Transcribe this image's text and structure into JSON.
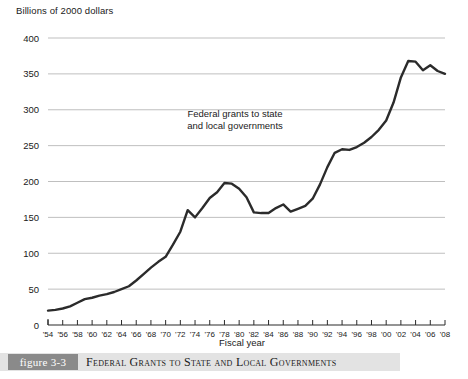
{
  "chart_data": {
    "type": "line",
    "title": "",
    "ylabel": "Billions of 2000 dollars",
    "xlabel": "Fiscal year",
    "annotation": "Federal grants to state and local governments",
    "annotation_lines": [
      "Federal grants to state",
      "and local governments"
    ],
    "ylim": [
      0,
      400
    ],
    "yticks": [
      0,
      50,
      100,
      150,
      200,
      250,
      300,
      350,
      400
    ],
    "ytick_labels": [
      "0",
      "50",
      "100",
      "150",
      "200",
      "250",
      "300",
      "350",
      "400"
    ],
    "grid": "horizontal",
    "legend": "none",
    "xlim": [
      1954,
      2008
    ],
    "xticks": [
      1954,
      1956,
      1958,
      1960,
      1962,
      1964,
      1966,
      1968,
      1970,
      1972,
      1974,
      1976,
      1978,
      1980,
      1982,
      1984,
      1986,
      1988,
      1990,
      1992,
      1994,
      1996,
      1998,
      2000,
      2002,
      2004,
      2006,
      2008
    ],
    "xtick_labels": [
      "'54",
      "'56",
      "'58",
      "'60",
      "'62",
      "'64",
      "'66",
      "'68",
      "'70",
      "'72",
      "'74",
      "'76",
      "'78",
      "'80",
      "'82",
      "'84",
      "'86",
      "'88",
      "'90",
      "'92",
      "'94",
      "'96",
      "'98",
      "'00",
      "'02",
      "'04",
      "'06",
      "'08"
    ],
    "series": [
      {
        "name": "Federal grants to state and local governments",
        "color": "#2b2b2b",
        "x": [
          1954,
          1955,
          1956,
          1957,
          1958,
          1959,
          1960,
          1961,
          1962,
          1963,
          1964,
          1965,
          1966,
          1967,
          1968,
          1969,
          1970,
          1971,
          1972,
          1973,
          1974,
          1975,
          1976,
          1977,
          1978,
          1979,
          1980,
          1981,
          1982,
          1983,
          1984,
          1985,
          1986,
          1987,
          1988,
          1989,
          1990,
          1991,
          1992,
          1993,
          1994,
          1995,
          1996,
          1997,
          1998,
          1999,
          2000,
          2001,
          2002,
          2003,
          2004,
          2005,
          2006,
          2007,
          2008
        ],
        "values": [
          20,
          21,
          23,
          26,
          31,
          36,
          38,
          41,
          43,
          46,
          50,
          54,
          62,
          71,
          80,
          88,
          95,
          112,
          130,
          160,
          150,
          163,
          177,
          185,
          198,
          197,
          190,
          178,
          157,
          156,
          156,
          163,
          168,
          158,
          162,
          166,
          176,
          196,
          220,
          240,
          245,
          244,
          248,
          254,
          262,
          272,
          285,
          310,
          345,
          368,
          367,
          355,
          362,
          354,
          350
        ]
      }
    ]
  }
}
